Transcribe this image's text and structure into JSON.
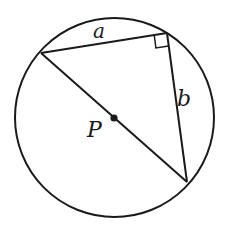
{
  "diagram": {
    "type": "geometry",
    "colors": {
      "stroke": "#1a1a1a",
      "background": "#ffffff"
    },
    "circle": {
      "cx": 114.5,
      "cy": 117.5,
      "r": 99.5,
      "center_label": "P"
    },
    "vertices": {
      "left": [
        41,
        53
      ],
      "top_right": [
        167,
        33
      ],
      "bottom_right": [
        187,
        182
      ]
    },
    "sides": {
      "top": {
        "label": "a"
      },
      "right": {
        "label": "b"
      },
      "hypotenuse": {
        "label": ""
      }
    },
    "labels": {
      "a": "a",
      "b": "b",
      "p": "P"
    },
    "right_angle_at": "top_right"
  }
}
